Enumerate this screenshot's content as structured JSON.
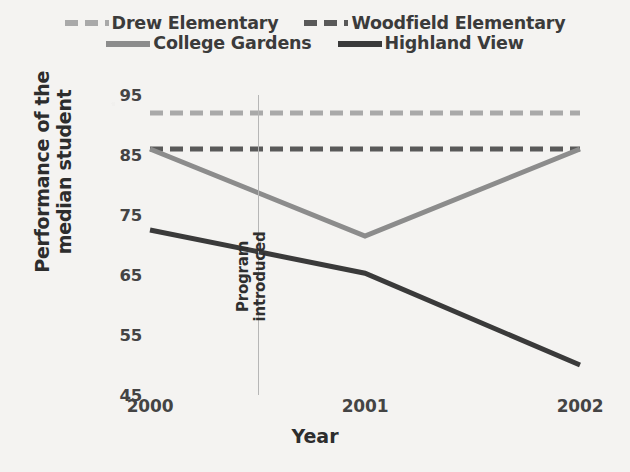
{
  "legend": {
    "rows": [
      [
        {
          "label": "Drew Elementary",
          "key": "drew"
        },
        {
          "label": "Woodfield Elementary",
          "key": "woodfield"
        }
      ],
      [
        {
          "label": "College Gardens",
          "key": "college"
        },
        {
          "label": "Highland View",
          "key": "highland"
        }
      ]
    ]
  },
  "annotation": {
    "line1": "Program",
    "line2": "introduced",
    "at_x": 2000.5
  },
  "chart_data": {
    "type": "line",
    "title": "",
    "xlabel": "Year",
    "ylabel": "Performance of the median student",
    "ylabel_line1": "Performance of the",
    "ylabel_line2": "median student",
    "categories": [
      "2000",
      "2001",
      "2002"
    ],
    "x": [
      2000,
      2001,
      2002
    ],
    "xlim": [
      2000,
      2002
    ],
    "ylim": [
      45,
      95
    ],
    "yticks": [
      45,
      55,
      65,
      75,
      85,
      95
    ],
    "grid": false,
    "legend_position": "top",
    "series": [
      {
        "name": "Drew Elementary",
        "values": [
          92,
          92,
          92
        ],
        "color": "#a9a9a9",
        "style": "dashed",
        "width": 5
      },
      {
        "name": "Woodfield Elementary",
        "values": [
          86,
          86,
          86
        ],
        "color": "#595959",
        "style": "dashed",
        "width": 5
      },
      {
        "name": "College Gardens",
        "values": [
          86,
          71.5,
          86
        ],
        "color": "#8c8c8c",
        "style": "solid",
        "width": 5
      },
      {
        "name": "Highland View",
        "values": [
          72.5,
          65.3,
          50
        ],
        "color": "#3a3a3a",
        "style": "solid",
        "width": 5
      }
    ],
    "annotations": [
      {
        "type": "vline",
        "x": 2000.5,
        "label": "Program introduced",
        "color": "#b6b6b6"
      }
    ]
  }
}
